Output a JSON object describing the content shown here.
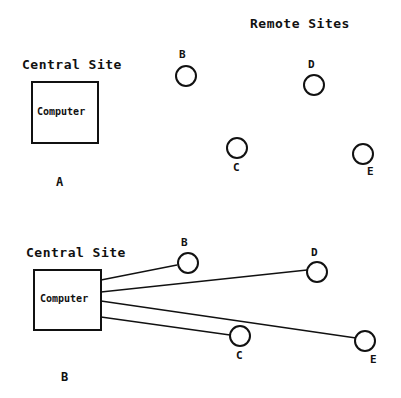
{
  "panel_a": {
    "label": "A",
    "central_title": "Central Site",
    "remote_title": "Remote Sites",
    "computer_label": "Computer",
    "nodes": [
      {
        "id": "B",
        "label": "B"
      },
      {
        "id": "C",
        "label": "C"
      },
      {
        "id": "D",
        "label": "D"
      },
      {
        "id": "E",
        "label": "E"
      }
    ]
  },
  "panel_b": {
    "label": "B",
    "central_title": "Central Site",
    "computer_label": "Computer",
    "nodes": [
      {
        "id": "B",
        "label": "B"
      },
      {
        "id": "C",
        "label": "C"
      },
      {
        "id": "D",
        "label": "D"
      },
      {
        "id": "E",
        "label": "E"
      }
    ],
    "connections": [
      "Computer-B",
      "Computer-D",
      "Computer-E",
      "Computer-C"
    ]
  },
  "colors": {
    "stroke": "#111111",
    "background": "#ffffff"
  }
}
